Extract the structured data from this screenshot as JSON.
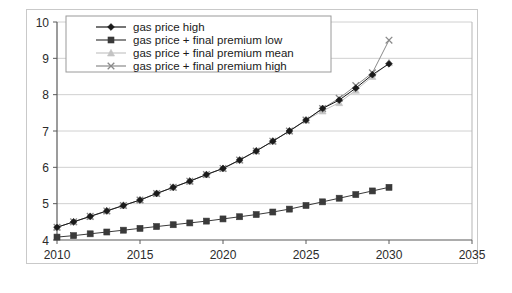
{
  "chart_data": {
    "type": "line",
    "title": "",
    "xlabel": "",
    "ylabel": "",
    "xlim": [
      2010,
      2035
    ],
    "ylim": [
      4,
      10
    ],
    "xticks": [
      2010,
      2015,
      2020,
      2025,
      2030,
      2035
    ],
    "yticks": [
      4,
      5,
      6,
      7,
      8,
      9,
      10
    ],
    "grid": true,
    "legend_position": "top-left-inside",
    "x": [
      2010,
      2011,
      2012,
      2013,
      2014,
      2015,
      2016,
      2017,
      2018,
      2019,
      2020,
      2021,
      2022,
      2023,
      2024,
      2025,
      2026,
      2027,
      2028,
      2029,
      2030
    ],
    "series": [
      {
        "name": "gas price high",
        "marker": "diamond",
        "color": "#1a1a1a",
        "values": [
          4.35,
          4.5,
          4.65,
          4.8,
          4.95,
          5.1,
          5.28,
          5.45,
          5.62,
          5.8,
          5.97,
          6.2,
          6.45,
          6.72,
          7.0,
          7.3,
          7.62,
          7.85,
          8.18,
          8.55,
          8.85
        ]
      },
      {
        "name": "gas price + final premium low",
        "marker": "square",
        "color": "#3a3a3a",
        "values": [
          4.08,
          4.12,
          4.17,
          4.22,
          4.27,
          4.32,
          4.37,
          4.42,
          4.47,
          4.52,
          4.58,
          4.64,
          4.7,
          4.77,
          4.85,
          4.95,
          5.05,
          5.15,
          5.25,
          5.35,
          5.45
        ]
      },
      {
        "name": "gas price + final premium mean",
        "marker": "triangle",
        "color": "#c4c4c4",
        "values": [
          4.35,
          4.5,
          4.65,
          4.8,
          4.95,
          5.1,
          5.28,
          5.45,
          5.62,
          5.8,
          5.97,
          6.2,
          6.45,
          6.72,
          7.0,
          7.3,
          7.55,
          7.78,
          8.12,
          8.5,
          8.88
        ]
      },
      {
        "name": "gas price + final premium high",
        "marker": "x",
        "color": "#8a8a8a",
        "values": [
          4.35,
          4.5,
          4.65,
          4.8,
          4.95,
          5.1,
          5.28,
          5.45,
          5.62,
          5.8,
          5.97,
          6.2,
          6.45,
          6.72,
          7.0,
          7.3,
          7.62,
          7.9,
          8.25,
          8.6,
          9.5
        ]
      }
    ]
  }
}
